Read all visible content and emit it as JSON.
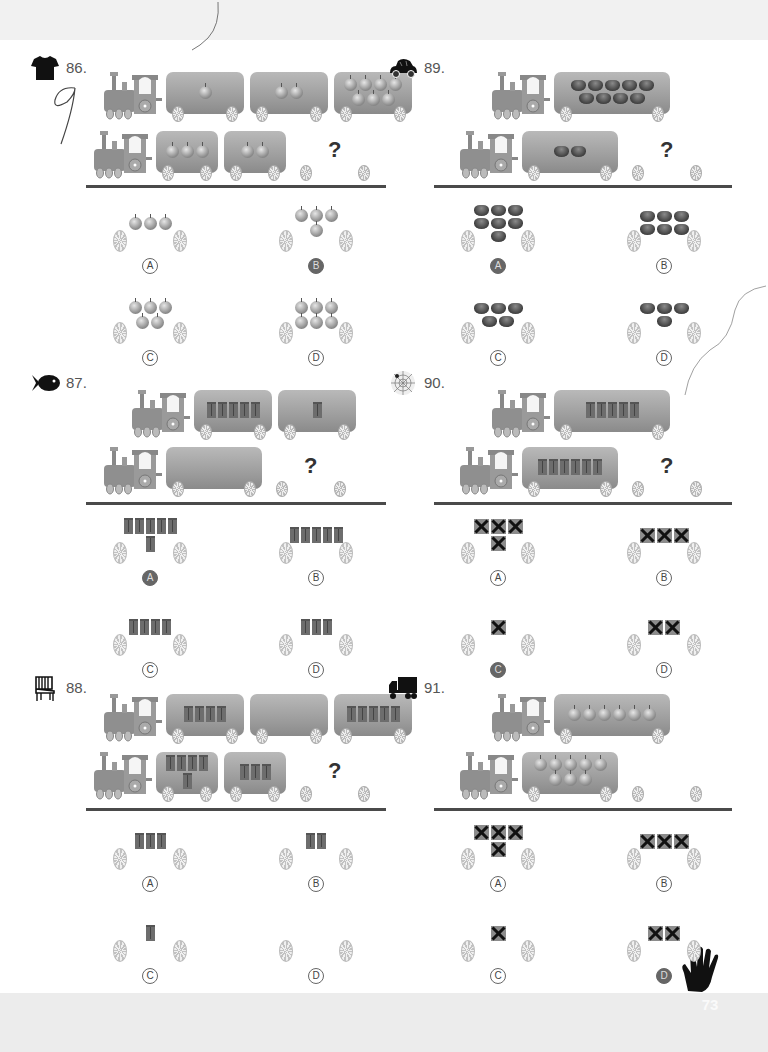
{
  "page": {
    "page_number": "73",
    "corner_icon": "hand-icon"
  },
  "problems": [
    {
      "number": "86.",
      "icon": "t-shirt-icon",
      "item_type": "apple",
      "handwritten_note": "9",
      "train_top": {
        "wagons": [
          1,
          2,
          7
        ]
      },
      "train_bottom": {
        "wagons": [
          3,
          2
        ],
        "missing": "?"
      },
      "options": [
        {
          "label": "A",
          "count": 3,
          "marked": false
        },
        {
          "label": "B",
          "count": 4,
          "marked": true
        },
        {
          "label": "C",
          "count": 5,
          "marked": false
        },
        {
          "label": "D",
          "count": 6,
          "marked": false
        }
      ]
    },
    {
      "number": "87.",
      "icon": "fish-icon",
      "item_type": "gift",
      "train_top": {
        "wagons": [
          5,
          1
        ]
      },
      "train_bottom": {
        "wagons": [
          0
        ],
        "missing": "?"
      },
      "options": [
        {
          "label": "A",
          "count": 6,
          "marked": true
        },
        {
          "label": "B",
          "count": 5,
          "marked": false
        },
        {
          "label": "C",
          "count": 4,
          "marked": false
        },
        {
          "label": "D",
          "count": 3,
          "marked": false
        }
      ]
    },
    {
      "number": "88.",
      "icon": "chair-icon",
      "item_type": "gift",
      "train_top": {
        "wagons": [
          4,
          0,
          5
        ]
      },
      "train_bottom": {
        "wagons": [
          5,
          3
        ],
        "missing": "?"
      },
      "options": [
        {
          "label": "A",
          "count": 3,
          "marked": false
        },
        {
          "label": "B",
          "count": 2,
          "marked": false
        },
        {
          "label": "C",
          "count": 1,
          "marked": false
        },
        {
          "label": "D",
          "count": 0,
          "marked": false
        }
      ]
    },
    {
      "number": "89.",
      "icon": "car-icon",
      "item_type": "basket",
      "train_top": {
        "wagons": [
          9
        ]
      },
      "train_bottom": {
        "wagons": [
          2
        ],
        "missing": "?"
      },
      "options": [
        {
          "label": "A",
          "count": 7,
          "marked": true
        },
        {
          "label": "B",
          "count": 6,
          "marked": false
        },
        {
          "label": "C",
          "count": 5,
          "marked": false
        },
        {
          "label": "D",
          "count": 4,
          "marked": false
        }
      ]
    },
    {
      "number": "90.",
      "icon": "spider-web-icon",
      "item_type": "gift",
      "train_top": {
        "wagons": [
          5
        ]
      },
      "train_bottom": {
        "wagons": [
          6
        ],
        "missing": "?"
      },
      "options": [
        {
          "label": "A",
          "count": 4,
          "marked": false
        },
        {
          "label": "B",
          "count": 3,
          "marked": false
        },
        {
          "label": "C",
          "count": 1,
          "marked": true
        },
        {
          "label": "D",
          "count": 2,
          "marked": false
        }
      ]
    },
    {
      "number": "91.",
      "icon": "truck-icon",
      "item_type": "apple",
      "train_top": {
        "wagons": [
          6
        ]
      },
      "train_bottom": {
        "wagons": [
          8
        ],
        "missing": ""
      },
      "options": [
        {
          "label": "A",
          "count": 4,
          "marked": false
        },
        {
          "label": "B",
          "count": 3,
          "marked": false
        },
        {
          "label": "C",
          "count": 1,
          "marked": false
        },
        {
          "label": "D",
          "count": 2,
          "marked": true
        }
      ]
    }
  ]
}
